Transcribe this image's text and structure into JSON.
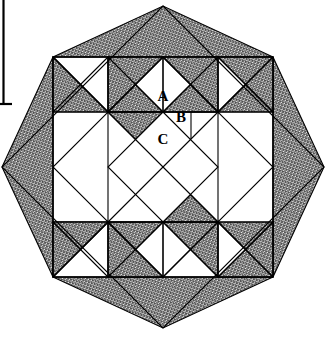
{
  "figure": {
    "canvas": {
      "width": 327,
      "height": 339,
      "background": "#ffffff"
    },
    "colors": {
      "outline": "#000000",
      "shaded_fill": "#808080",
      "unshaded_fill": "#ffffff",
      "page_border": "#000000"
    },
    "geometry": {
      "diamond_center_x": 163,
      "diamond_center_y": 167,
      "diamond_half_diagonal": 161,
      "inner_square_half_side": 110,
      "center_diamond_half_diagonal": 55,
      "unit": 27.5
    },
    "labels": [
      {
        "id": "A",
        "text": "A",
        "x": 163,
        "y": 98
      },
      {
        "id": "B",
        "text": "B",
        "x": 181,
        "y": 119
      },
      {
        "id": "C",
        "text": "C",
        "x": 163,
        "y": 141
      }
    ],
    "page_border": {
      "vertical_x": 3,
      "vertical_top": 0,
      "vertical_bottom": 105,
      "stub_width": 9
    }
  }
}
